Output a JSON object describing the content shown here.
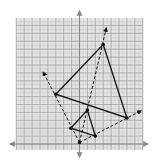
{
  "diagram": {
    "type": "dilation-on-coordinate-grid",
    "grid": {
      "x_range": [
        -8,
        8
      ],
      "y_range": [
        -1,
        16
      ],
      "unit": 1,
      "major_every": 2
    },
    "colors": {
      "grid_bg": "#e4e4e4",
      "grid_minor": "#c4c4c4",
      "grid_major": "#9a9a9a",
      "axis": "#8a8a8a",
      "figure": "#111111"
    },
    "center_of_dilation": {
      "label": "",
      "x": 0,
      "y": 0.2
    },
    "preimage": {
      "name": "small-triangle",
      "vertices": [
        {
          "x": -1.1,
          "y": 2.0
        },
        {
          "x": 1.0,
          "y": 4.3
        },
        {
          "x": 2.0,
          "y": 1.0
        }
      ]
    },
    "image": {
      "name": "large-triangle",
      "vertices": [
        {
          "x": -3.0,
          "y": 6.3
        },
        {
          "x": 3.0,
          "y": 12.6
        },
        {
          "x": 6.0,
          "y": 3.3
        }
      ]
    },
    "rays": [
      {
        "to": {
          "x": -4.6,
          "y": 9.1
        }
      },
      {
        "to": {
          "x": 3.4,
          "y": 14.7
        }
      },
      {
        "to": {
          "x": 7.8,
          "y": 4.2
        }
      }
    ]
  }
}
